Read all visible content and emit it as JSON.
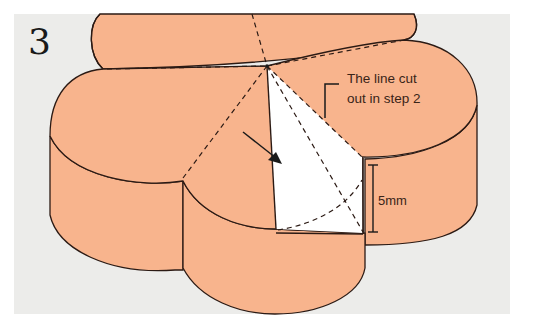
{
  "figure": {
    "step_number": "3",
    "callout_label_line1": "The line cut",
    "callout_label_line2": "out in step 2",
    "measurement_label": "5mm",
    "caption_partial": ""
  },
  "colors": {
    "panel_background": "#ececea",
    "shape_fill": "#f8b48d",
    "cut_fill": "#ffffff",
    "outline": "#2b1a14"
  }
}
